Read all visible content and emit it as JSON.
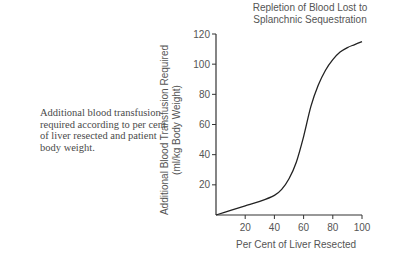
{
  "caption": "Additional blood transfusion required according to per cent of liver resected and patient body weight.",
  "chart_data": {
    "type": "line",
    "title": "Repletion of Blood Lost to Splanchnic Sequestration",
    "title_lines": [
      "Repletion of Blood Lost to",
      "Splanchnic Sequestration"
    ],
    "xlabel": "Per Cent of Liver Resected",
    "ylabel": "Additional Blood Transfusion Required (ml/kg Body Weight)",
    "ylabel_lines": [
      "Additional Blood Transfusion Required",
      "(ml/kg Body Weight)"
    ],
    "xlim": [
      0,
      100
    ],
    "ylim": [
      0,
      120
    ],
    "x_ticks": [
      20,
      40,
      60,
      80,
      100
    ],
    "y_ticks": [
      20,
      40,
      60,
      80,
      100,
      120
    ],
    "grid": false,
    "series": [
      {
        "name": "Additional transfusion",
        "x": [
          0,
          10,
          20,
          30,
          40,
          45,
          50,
          55,
          60,
          65,
          70,
          75,
          80,
          85,
          90,
          95,
          100
        ],
        "y": [
          0,
          3,
          6,
          9,
          13,
          17,
          24,
          35,
          52,
          72,
          86,
          96,
          103,
          108,
          111,
          113,
          115
        ]
      }
    ],
    "legend": null
  }
}
